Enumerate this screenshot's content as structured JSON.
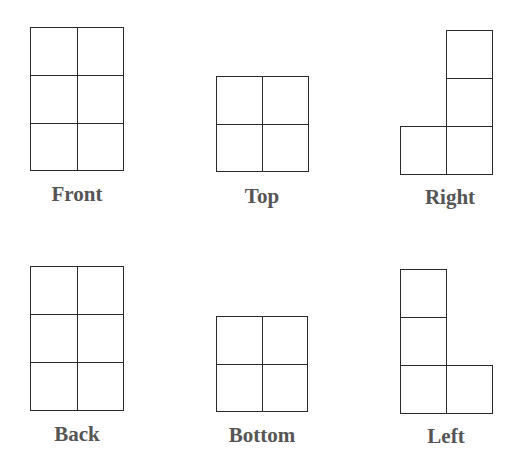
{
  "diagram": {
    "cell_size": 47,
    "line_color": "#2a2a2a",
    "label_color": "#555555",
    "views": [
      {
        "name": "Front",
        "label": "Front",
        "cols": 2,
        "rows": 3,
        "cells": [
          [
            0,
            0
          ],
          [
            1,
            0
          ],
          [
            0,
            1
          ],
          [
            1,
            1
          ],
          [
            0,
            2
          ],
          [
            1,
            2
          ]
        ]
      },
      {
        "name": "Top",
        "label": "Top",
        "cols": 2,
        "rows": 2,
        "cells": [
          [
            0,
            0
          ],
          [
            1,
            0
          ],
          [
            0,
            1
          ],
          [
            1,
            1
          ]
        ]
      },
      {
        "name": "Right",
        "label": "Right",
        "cols": 2,
        "rows": 3,
        "cells": [
          [
            1,
            0
          ],
          [
            1,
            1
          ],
          [
            0,
            2
          ],
          [
            1,
            2
          ]
        ]
      },
      {
        "name": "Back",
        "label": "Back",
        "cols": 2,
        "rows": 3,
        "cells": [
          [
            0,
            0
          ],
          [
            1,
            0
          ],
          [
            0,
            1
          ],
          [
            1,
            1
          ],
          [
            0,
            2
          ],
          [
            1,
            2
          ]
        ]
      },
      {
        "name": "Bottom",
        "label": "Bottom",
        "cols": 2,
        "rows": 2,
        "cells": [
          [
            0,
            0
          ],
          [
            1,
            0
          ],
          [
            0,
            1
          ],
          [
            1,
            1
          ]
        ]
      },
      {
        "name": "Left",
        "label": "Left",
        "cols": 2,
        "rows": 3,
        "cells": [
          [
            0,
            0
          ],
          [
            0,
            1
          ],
          [
            0,
            2
          ],
          [
            1,
            2
          ]
        ]
      }
    ]
  }
}
